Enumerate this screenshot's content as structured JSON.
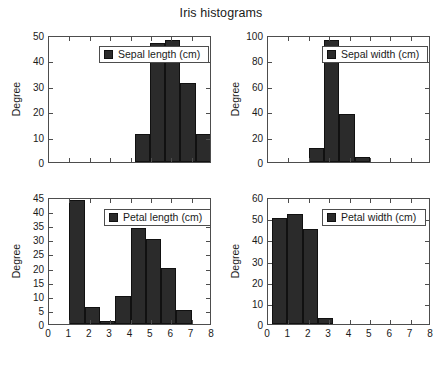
{
  "figure": {
    "title": "Iris histograms",
    "bar_color": "#2b2b2b",
    "axis_color": "#4d4d4d",
    "background": "#ffffff"
  },
  "chart_data": [
    {
      "type": "bar",
      "id": "sepal-length",
      "title": "",
      "position": "top-left",
      "legend": "Sepal length (cm)",
      "legend_position": "upper center",
      "xlabel": "",
      "ylabel": "Degree",
      "xlim": [
        0,
        8
      ],
      "ylim": [
        0,
        50
      ],
      "xticks": [
        0,
        1,
        2,
        3,
        4,
        5,
        6,
        7,
        8
      ],
      "xticklabels": [
        "",
        "",
        "",
        "",
        "",
        "",
        "",
        "",
        ""
      ],
      "yticks": [
        0,
        10,
        20,
        30,
        40,
        50
      ],
      "yticklabels": [
        "0",
        "10",
        "20",
        "30",
        "40",
        "50"
      ],
      "grid": false,
      "bin_edges": [
        4.2,
        4.95,
        5.7,
        6.45,
        7.2,
        7.95
      ],
      "bar_width": 0.75,
      "bin_centers": [
        4.575,
        5.325,
        6.075,
        6.825,
        7.575
      ],
      "values": [
        11,
        47,
        48,
        31,
        11
      ]
    },
    {
      "type": "bar",
      "id": "sepal-width",
      "title": "",
      "position": "top-right",
      "legend": "Sepal width (cm)",
      "legend_position": "upper center",
      "xlabel": "",
      "ylabel": "Degree",
      "xlim": [
        0,
        8
      ],
      "ylim": [
        0,
        100
      ],
      "xticks": [
        0,
        1,
        2,
        3,
        4,
        5,
        6,
        7,
        8
      ],
      "xticklabels": [
        "",
        "",
        "",
        "",
        "",
        "",
        "",
        "",
        ""
      ],
      "yticks": [
        0,
        20,
        40,
        60,
        80,
        100
      ],
      "yticklabels": [
        "0",
        "20",
        "40",
        "60",
        "80",
        "100"
      ],
      "grid": false,
      "bin_edges": [
        2.0,
        2.75,
        3.5,
        4.25,
        5.0
      ],
      "bar_width": 0.75,
      "bin_centers": [
        2.375,
        3.125,
        3.875,
        4.625
      ],
      "values": [
        11,
        96,
        38,
        4
      ]
    },
    {
      "type": "bar",
      "id": "petal-length",
      "title": "",
      "position": "bottom-left",
      "legend": "Petal length (cm)",
      "legend_position": "upper center",
      "xlabel": "",
      "ylabel": "Degree",
      "xlim": [
        0,
        8
      ],
      "ylim": [
        0,
        45
      ],
      "xticks": [
        0,
        1,
        2,
        3,
        4,
        5,
        6,
        7,
        8
      ],
      "xticklabels": [
        "0",
        "1",
        "2",
        "3",
        "4",
        "5",
        "6",
        "7",
        "8"
      ],
      "yticks": [
        0,
        5,
        10,
        15,
        20,
        25,
        30,
        35,
        40,
        45
      ],
      "yticklabels": [
        "0",
        "5",
        "10",
        "15",
        "20",
        "25",
        "30",
        "35",
        "40",
        "45"
      ],
      "grid": false,
      "bin_edges": [
        1.0,
        1.75,
        2.5,
        3.25,
        4.0,
        4.75,
        5.5,
        6.25,
        7.0
      ],
      "bar_width": 0.75,
      "bin_centers": [
        1.375,
        2.125,
        2.875,
        3.625,
        4.375,
        5.125,
        5.875,
        6.625
      ],
      "values": [
        44,
        6,
        1,
        10,
        34,
        30,
        20,
        5
      ]
    },
    {
      "type": "bar",
      "id": "petal-width",
      "title": "",
      "position": "bottom-right",
      "legend": "Petal width (cm)",
      "legend_position": "upper center",
      "xlabel": "",
      "ylabel": "Degree",
      "xlim": [
        0,
        8
      ],
      "ylim": [
        0,
        60
      ],
      "xticks": [
        0,
        1,
        2,
        3,
        4,
        5,
        6,
        7,
        8
      ],
      "xticklabels": [
        "0",
        "1",
        "2",
        "3",
        "4",
        "5",
        "6",
        "7",
        "8"
      ],
      "yticks": [
        0,
        10,
        20,
        30,
        40,
        50,
        60
      ],
      "yticklabels": [
        "0",
        "10",
        "20",
        "30",
        "40",
        "50",
        "60"
      ],
      "grid": false,
      "bin_edges": [
        0.2,
        0.95,
        1.7,
        2.45,
        3.2
      ],
      "bar_width": 0.75,
      "bin_centers": [
        0.575,
        1.325,
        2.075,
        2.825
      ],
      "values": [
        50,
        52,
        45,
        3
      ]
    }
  ]
}
